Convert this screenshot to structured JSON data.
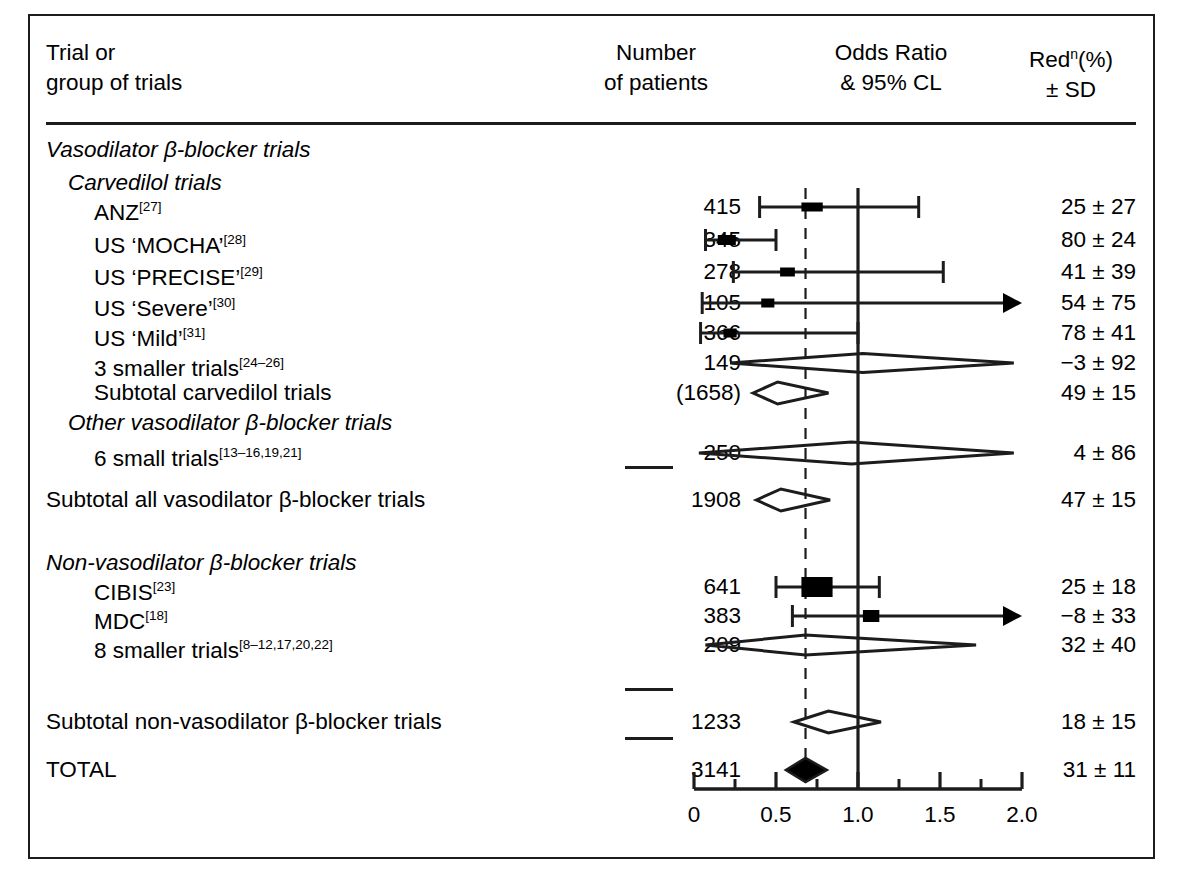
{
  "header": {
    "col_trial_l1": "Trial or",
    "col_trial_l2": "group of trials",
    "col_number_l1": "Number",
    "col_number_l2": "of patients",
    "col_or_l1": "Odds Ratio",
    "col_or_l2": "& 95% CL",
    "col_red_l1_pre": "Red",
    "col_red_l1_sup": "n",
    "col_red_l1_post": "(%)",
    "col_red_l2": "± SD"
  },
  "rows": [
    {
      "label": "Vasodilator β-blocker trials",
      "style": "heading-italic",
      "indent": 0,
      "number": "",
      "red": ""
    },
    {
      "label": "Carvedilol trials",
      "style": "heading-italic",
      "indent": 1,
      "number": "",
      "red": ""
    },
    {
      "label": "ANZ",
      "ref": "[27]",
      "style": "trial",
      "indent": 2,
      "number": "415",
      "red": "25 ± 27"
    },
    {
      "label": "US ‘MOCHA’",
      "ref": "[28]",
      "style": "trial",
      "indent": 2,
      "number": "345",
      "red": "80 ± 24"
    },
    {
      "label": "US ‘PRECISE’",
      "ref": "[29]",
      "style": "trial",
      "indent": 2,
      "number": "278",
      "red": "41 ± 39"
    },
    {
      "label": "US ‘Severe’",
      "ref": "[30]",
      "style": "trial",
      "indent": 2,
      "number": "105",
      "red": "54 ± 75"
    },
    {
      "label": "US ‘Mild’",
      "ref": "[31]",
      "style": "trial",
      "indent": 2,
      "number": "366",
      "red": "78 ± 41"
    },
    {
      "label": "3 smaller trials",
      "ref": "[24–26]",
      "style": "trial",
      "indent": 2,
      "number": "149",
      "red": "−3 ± 92"
    },
    {
      "label": "Subtotal carvedilol trials",
      "style": "subtotal",
      "indent": 2,
      "number": "(1658)",
      "red": "49 ± 15"
    },
    {
      "label": "Other vasodilator β-blocker trials",
      "style": "heading-italic",
      "indent": 1,
      "number": "",
      "red": ""
    },
    {
      "label": "6 small trials",
      "ref": "[13–16,19,21]",
      "style": "trial",
      "indent": 2,
      "number": "250",
      "red": "4 ± 86"
    },
    {
      "label": "Subtotal all vasodilator β-blocker trials",
      "style": "subtotal",
      "indent": 0,
      "number": "1908",
      "red": "47 ± 15"
    },
    {
      "label": "Non-vasodilator β-blocker trials",
      "style": "heading-italic",
      "indent": 0,
      "number": "",
      "red": ""
    },
    {
      "label": "CIBIS",
      "ref": "[23]",
      "style": "trial",
      "indent": 2,
      "number": "641",
      "red": "25 ± 18"
    },
    {
      "label": "MDC",
      "ref": "[18]",
      "style": "trial",
      "indent": 2,
      "number": "383",
      "red": "−8 ± 33"
    },
    {
      "label": "8 smaller trials",
      "ref": "[8–12,17,20,22]",
      "style": "trial",
      "indent": 2,
      "number": "209",
      "red": "32 ± 40"
    },
    {
      "label": "Subtotal non-vasodilator β-blocker trials",
      "style": "subtotal",
      "indent": 0,
      "number": "1233",
      "red": "18 ± 15"
    },
    {
      "label": "TOTAL",
      "style": "total",
      "indent": 0,
      "number": "3141",
      "red": "31 ± 11"
    }
  ],
  "chart_data": {
    "type": "forest",
    "title": "Odds Ratio & 95% CL",
    "xlabel": "",
    "ylabel": "",
    "xlim": [
      0,
      2.0
    ],
    "major_ticks": [
      0,
      0.5,
      1.0,
      1.5,
      2.0
    ],
    "tick_labels": [
      "0",
      "0.5",
      "1.0",
      "1.5",
      "2.0"
    ],
    "minor_ticks": [
      0.25,
      0.75,
      1.25,
      1.75
    ],
    "grid": false,
    "reference_line_solid": 1.0,
    "reference_line_dashed": 0.68,
    "color_marker": "#000000",
    "color_line": "#1c1c1c",
    "entries": [
      {
        "name": "ANZ",
        "marker": "box",
        "or": 0.72,
        "lo": 0.4,
        "hi": 1.37,
        "box_w": 0.13,
        "box_h": 9,
        "arrow_right": false,
        "row": 2
      },
      {
        "name": "US 'MOCHA'",
        "marker": "box",
        "or": 0.2,
        "lo": 0.07,
        "hi": 0.5,
        "box_w": 0.11,
        "box_h": 10,
        "arrow_right": false,
        "row": 3
      },
      {
        "name": "US 'PRECISE'",
        "marker": "box",
        "or": 0.57,
        "lo": 0.24,
        "hi": 1.52,
        "box_w": 0.09,
        "box_h": 9,
        "arrow_right": false,
        "row": 4
      },
      {
        "name": "US 'Severe'",
        "marker": "box",
        "or": 0.45,
        "lo": 0.05,
        "hi": 2.0,
        "box_w": 0.08,
        "box_h": 9,
        "arrow_right": true,
        "row": 5
      },
      {
        "name": "US 'Mild'",
        "marker": "box",
        "or": 0.22,
        "lo": 0.04,
        "hi": 1.0,
        "box_w": 0.08,
        "box_h": 9,
        "arrow_right": false,
        "row": 6
      },
      {
        "name": "3 smaller trials",
        "marker": "diamond-open",
        "or": 1.03,
        "lo": 0.22,
        "hi": 1.95,
        "diamond_h": 19,
        "row": 7
      },
      {
        "name": "Subtotal carvedilol trials",
        "marker": "diamond-open",
        "or": 0.51,
        "lo": 0.36,
        "hi": 0.82,
        "diamond_h": 22,
        "row": 8
      },
      {
        "name": "6 small trials",
        "marker": "diamond-open",
        "or": 0.96,
        "lo": 0.03,
        "hi": 1.95,
        "diamond_h": 22,
        "row": 10
      },
      {
        "name": "Subtotal all vasodilator",
        "marker": "diamond-open",
        "or": 0.53,
        "lo": 0.38,
        "hi": 0.83,
        "diamond_h": 22,
        "row": 11
      },
      {
        "name": "CIBIS",
        "marker": "box",
        "or": 0.75,
        "lo": 0.5,
        "hi": 1.13,
        "box_w": 0.19,
        "box_h": 20,
        "arrow_right": false,
        "row": 13
      },
      {
        "name": "MDC",
        "marker": "box",
        "or": 1.08,
        "lo": 0.6,
        "hi": 2.0,
        "box_w": 0.1,
        "box_h": 12,
        "arrow_right": true,
        "row": 14
      },
      {
        "name": "8 smaller trials",
        "marker": "diamond-open",
        "or": 0.68,
        "lo": 0.07,
        "hi": 1.72,
        "diamond_h": 20,
        "row": 15
      },
      {
        "name": "Subtotal non-vasodilator",
        "marker": "diamond-open",
        "or": 0.82,
        "lo": 0.61,
        "hi": 1.14,
        "diamond_h": 22,
        "row": 16
      },
      {
        "name": "TOTAL",
        "marker": "diamond-filled",
        "or": 0.68,
        "lo": 0.56,
        "hi": 0.81,
        "diamond_h": 24,
        "row": 17
      }
    ]
  }
}
